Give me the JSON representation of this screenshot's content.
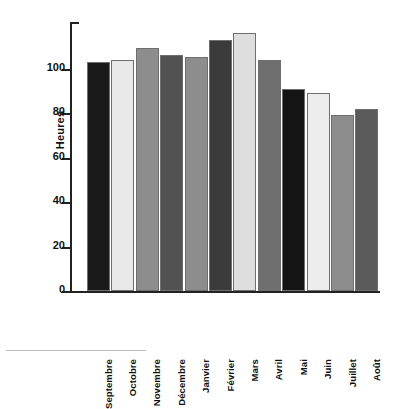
{
  "chart_data": {
    "type": "bar",
    "title": "",
    "xlabel": "",
    "ylabel": "Heures",
    "categories": [
      "Septembre",
      "Octobre",
      "Novembre",
      "Décembre",
      "Janvier",
      "Février",
      "Mars",
      "Avril",
      "Mai",
      "Juin",
      "Juillet",
      "Août"
    ],
    "values": [
      103,
      104,
      109,
      106,
      105,
      113,
      116,
      104,
      91,
      89,
      79,
      82
    ],
    "bar_colors": [
      "#1a1a1a",
      "#e9e9e9",
      "#8d8d8d",
      "#525252",
      "#8d8d8d",
      "#3b3b3b",
      "#dedede",
      "#6e6e6e",
      "#141414",
      "#ededed",
      "#8d8d8d",
      "#5a5a5a"
    ],
    "ylim": [
      0,
      120
    ],
    "yticks": [
      0,
      20,
      40,
      60,
      80,
      100
    ],
    "ytick_labels": [
      "0",
      "20",
      "40",
      "60",
      "80",
      "100"
    ],
    "grid": false,
    "legend": null,
    "legend_position": "none",
    "axis_color": "#222222"
  }
}
